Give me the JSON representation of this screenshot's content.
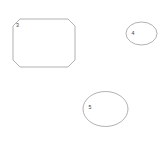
{
  "canvas": {
    "width": 165,
    "height": 149,
    "background_color": "#ffffff",
    "stroke_color": "#8f8f8f",
    "label_color": "#3a3a3a",
    "stroke_width": 0.7
  },
  "shapes": [
    {
      "id": "octagon",
      "kind": "octagon",
      "label": "3",
      "label_x": 17.5,
      "label_y": 26,
      "x": 13,
      "y": 19,
      "width": 62,
      "height": 48,
      "bevel": 7,
      "points": "20,19 68,19 75,26 75,60 68,67 20,67 13,60 13,26"
    },
    {
      "id": "ellipse-small",
      "kind": "ellipse",
      "label": "4",
      "label_x": 133,
      "label_y": 33.5,
      "cx": 141.5,
      "cy": 33.5,
      "rx": 15.5,
      "ry": 11.5
    },
    {
      "id": "ellipse-large",
      "kind": "ellipse",
      "label": "5",
      "label_x": 90,
      "label_y": 108,
      "cx": 105.5,
      "cy": 109,
      "rx": 22.5,
      "ry": 17.5
    }
  ]
}
